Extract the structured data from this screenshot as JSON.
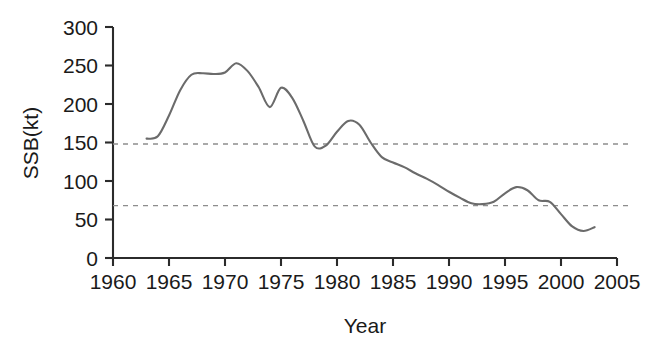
{
  "chart_data": {
    "type": "line",
    "title": "",
    "xlabel": "Year",
    "ylabel": "SSB(kt)",
    "xlim": [
      1960,
      2005
    ],
    "ylim": [
      0,
      300
    ],
    "grid": false,
    "legend": null,
    "x_ticks": [
      1960,
      1965,
      1970,
      1975,
      1980,
      1985,
      1990,
      1995,
      2000,
      2005
    ],
    "x_tick_labels": [
      "1960",
      "1965",
      "1970",
      "1975",
      "1980",
      "1985",
      "1990",
      "1995",
      "2000",
      "2005"
    ],
    "y_ticks": [
      0,
      50,
      100,
      150,
      200,
      250,
      300
    ],
    "y_tick_labels": [
      "0",
      "50",
      "100",
      "150",
      "200",
      "250",
      "300"
    ],
    "line_color": "#6b6b6b",
    "reference_lines": [
      {
        "name": "upper-reference-line",
        "value": 148,
        "style": "dashed",
        "color": "#8d8d8d"
      },
      {
        "name": "lower-reference-line",
        "value": 68,
        "style": "dashed",
        "color": "#8d8d8d"
      }
    ],
    "series": [
      {
        "name": "SSB",
        "color": "#6b6b6b",
        "x": [
          1963,
          1964,
          1965,
          1966,
          1967,
          1968,
          1969,
          1970,
          1971,
          1972,
          1973,
          1974,
          1975,
          1976,
          1977,
          1978,
          1979,
          1980,
          1981,
          1982,
          1983,
          1984,
          1985,
          1986,
          1987,
          1988,
          1989,
          1990,
          1991,
          1992,
          1993,
          1994,
          1995,
          1996,
          1997,
          1998,
          1999,
          2000,
          2001,
          2002,
          2003
        ],
        "values": [
          155,
          158,
          185,
          218,
          238,
          240,
          239,
          241,
          253,
          243,
          222,
          196,
          221,
          208,
          178,
          145,
          146,
          164,
          178,
          173,
          150,
          131,
          124,
          118,
          110,
          103,
          95,
          86,
          78,
          71,
          70,
          73,
          84,
          92,
          88,
          75,
          73,
          57,
          41,
          35,
          40
        ]
      }
    ]
  }
}
